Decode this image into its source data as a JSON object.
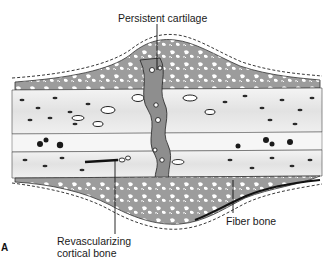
{
  "figure": {
    "panel_label": "A",
    "labels": {
      "top": "Persistent cartilage",
      "bottom_left_line1": "Revascularizing",
      "bottom_left_line2": "cortical bone",
      "bottom_right": "Fiber bone"
    },
    "colors": {
      "background": "#ffffff",
      "ink": "#1a1a1a",
      "callus_gray": "#9a9a9a",
      "cortex_light": "#e8e8e8"
    }
  }
}
